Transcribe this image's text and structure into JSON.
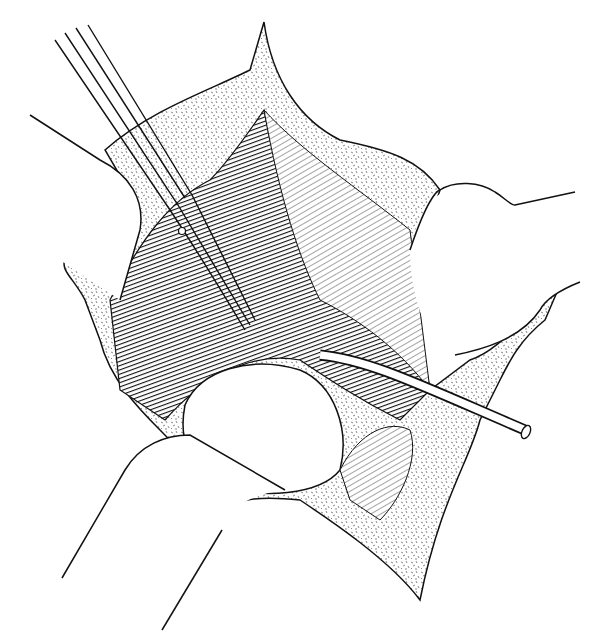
{
  "figure": {
    "kind": "surgical-illustration",
    "style": "black-and-white pen-and-ink line drawing with stippling and hatching",
    "background_color": "#ffffff",
    "ink_color": "#111111",
    "elements": [
      {
        "id": "scissors",
        "label": "curved surgical scissors"
      },
      {
        "id": "catheter",
        "label": "tube / catheter"
      },
      {
        "id": "retractor-left-upper",
        "label": "retractor blade (upper left)"
      },
      {
        "id": "retractor-left-lower",
        "label": "retractor blade (lower left)"
      },
      {
        "id": "retractor-right",
        "label": "retractor blade (right)"
      },
      {
        "id": "skin-edges",
        "label": "stippled wound edges"
      },
      {
        "id": "muscle",
        "label": "hatched muscle tissue"
      },
      {
        "id": "organ",
        "label": "rounded organ in wound floor"
      }
    ]
  }
}
